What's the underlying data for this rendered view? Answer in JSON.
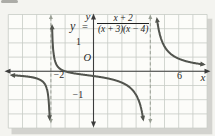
{
  "figure": {
    "equation": {
      "lhs": "y",
      "equals": "=",
      "numerator": "x + 2",
      "denominator": "(x + 3)(x − 4)"
    },
    "labels": {
      "origin": "O",
      "x_axis": "x",
      "y_axis": "y",
      "x_tick_left": "−2",
      "x_tick_right": "6",
      "y_tick_top": "1",
      "y_tick_bottom": "−1"
    }
  },
  "chart_data": {
    "type": "line",
    "xlabel": "x",
    "ylabel": "y",
    "xlim": [
      -6,
      8.5
    ],
    "ylim": [
      -2.1,
      2.1
    ],
    "grid": true,
    "shown_x_tick_labels": [
      -2,
      6
    ],
    "shown_y_tick_labels": [
      1,
      -1
    ],
    "vertical_asymptotes": [
      -3,
      4
    ],
    "horizontal_asymptote": 0,
    "x_intercept": -2,
    "y_intercept": -0.167,
    "function": {
      "expression": "(x+2)/((x+3)(x-4))",
      "numerator_roots": [
        -2
      ],
      "denominator_roots": [
        -3,
        4
      ]
    },
    "branches": [
      {
        "name": "left",
        "x_range": [
          -5.7,
          -3.05
        ],
        "end_arrows": [
          "left",
          "down"
        ],
        "points": [
          [
            -5.7,
            -0.14
          ],
          [
            -5,
            -0.17
          ],
          [
            -4,
            -0.25
          ],
          [
            -3.5,
            -0.4
          ],
          [
            -3.2,
            -0.83
          ],
          [
            -3.1,
            -1.55
          ]
        ]
      },
      {
        "name": "middle",
        "x_range": [
          -2.97,
          3.6
        ],
        "end_arrows": [
          "up",
          "down"
        ],
        "points": [
          [
            -2.9,
            1.3
          ],
          [
            -2.8,
            0.59
          ],
          [
            -2.5,
            0.15
          ],
          [
            -2,
            0
          ],
          [
            -1,
            -0.1
          ],
          [
            0,
            -0.17
          ],
          [
            1,
            -0.25
          ],
          [
            2,
            -0.4
          ],
          [
            3,
            -0.83
          ],
          [
            3.5,
            -1.69
          ]
        ]
      },
      {
        "name": "right",
        "x_range": [
          4.03,
          7.7
        ],
        "end_arrows": [
          "up",
          "right"
        ],
        "points": [
          [
            4.5,
            1.73
          ],
          [
            5,
            0.88
          ],
          [
            6,
            0.44
          ],
          [
            7,
            0.3
          ],
          [
            7.7,
            0.24
          ]
        ]
      }
    ]
  },
  "colors": {
    "curve": "#52544e",
    "axis": "#3c3c3c",
    "grid": "#c7ccc5",
    "asymptote": "#999f94",
    "text": "#2a2a2a",
    "page_bg": "#f4f4f0",
    "panel_bg": "#fcfcf9",
    "shadow": "#9f9f98"
  }
}
